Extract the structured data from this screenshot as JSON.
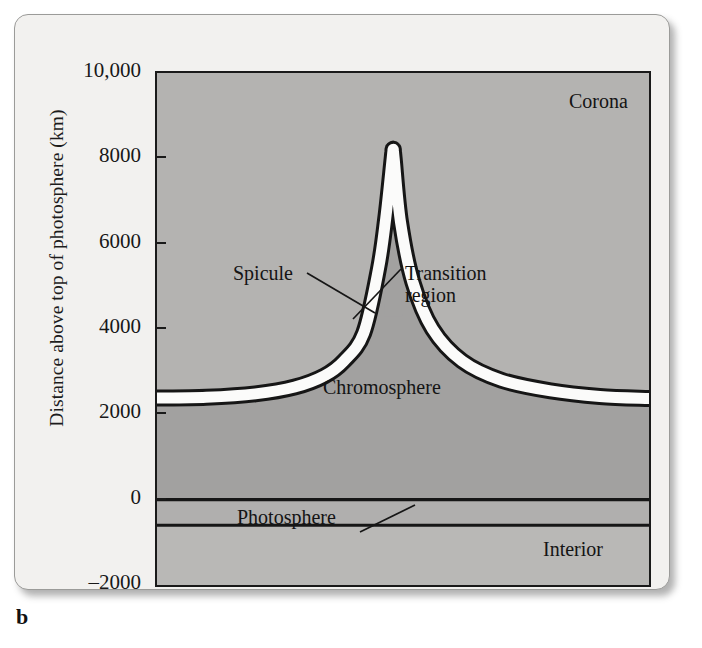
{
  "panel": {
    "letter": "b"
  },
  "axis": {
    "y_title": "Distance above top of photosphere (km)",
    "y_ticks": [
      {
        "label": "10,000",
        "value": 10000
      },
      {
        "label": "8000",
        "value": 8000
      },
      {
        "label": "6000",
        "value": 6000
      },
      {
        "label": "4000",
        "value": 4000
      },
      {
        "label": "2000",
        "value": 2000
      },
      {
        "label": "0",
        "value": 0
      },
      {
        "label": "–2000",
        "value": -2000
      }
    ],
    "y_min": -2000,
    "y_max": 10000
  },
  "labels": {
    "corona": "Corona",
    "chromosphere": "Chromosphere",
    "photosphere": "Photosphere",
    "interior": "Interior",
    "spicule": "Spicule",
    "transition_region_line1": "Transition",
    "transition_region_line2": "region"
  },
  "colors": {
    "corona_fill": "#b4b3b1",
    "chromosphere_fill": "#a2a1a0",
    "photosphere_fill": "#b0afae",
    "interior_fill": "#b9b8b6",
    "transition_band": "#fbfbfa",
    "outline": "#161616",
    "card_bg": "#f2f1ef",
    "text": "#141414"
  },
  "chart_data": {
    "type": "area",
    "xlabel": "",
    "ylabel": "Distance above top of photosphere (km)",
    "ylim": [
      -2000,
      10000
    ],
    "grid": false,
    "legend": "none",
    "annotations": [
      {
        "text": "Corona",
        "region": "above transition region, top right"
      },
      {
        "text": "Chromosphere",
        "region": "between photosphere and transition region"
      },
      {
        "text": "Photosphere",
        "region": "thin band from -600 km to 0 km"
      },
      {
        "text": "Interior",
        "region": "below photosphere, bottom right"
      },
      {
        "text": "Spicule",
        "leader": "points to left flank of spicule jet"
      },
      {
        "text": "Transition region",
        "leader": "points to right flank white band"
      }
    ],
    "layers": [
      {
        "name": "Interior",
        "y_bottom": -2000,
        "y_top": -600
      },
      {
        "name": "Photosphere",
        "y_bottom": -600,
        "y_top": 0
      },
      {
        "name": "Chromosphere",
        "y_bottom": 0,
        "y_top": 2350
      },
      {
        "name": "Transition region",
        "y_bottom": 2350,
        "y_top": 2550
      },
      {
        "name": "Corona",
        "y_bottom": 2550,
        "y_top": 10000
      }
    ],
    "series": [
      {
        "name": "Transition region height (km) vs horizontal position",
        "x": [
          0,
          0.1,
          0.2,
          0.28,
          0.34,
          0.38,
          0.42,
          0.45,
          0.465,
          0.478,
          0.48,
          0.482,
          0.495,
          0.52,
          0.56,
          0.62,
          0.7,
          0.8,
          0.9,
          1.0
        ],
        "values": [
          2380,
          2400,
          2480,
          2640,
          2900,
          3250,
          3900,
          5400,
          6600,
          8000,
          8200,
          8000,
          6500,
          5100,
          4000,
          3250,
          2800,
          2550,
          2420,
          2370
        ]
      },
      {
        "name": "Spicule inner notch top (km)",
        "x": [
          0.478,
          0.48,
          0.482
        ],
        "values": [
          7050,
          7100,
          7050
        ]
      }
    ],
    "spicule": {
      "peak_height_km": 8200,
      "inner_notch_km": 7100,
      "base_height_km": 2380
    }
  }
}
